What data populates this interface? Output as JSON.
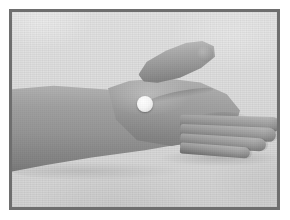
{
  "image": {
    "caption": "Round white tablet resting on the back of an outstretched hand",
    "subject": "forearm and hand, palm down, extended horizontally to the right",
    "orientation": "landscape",
    "color_mode": "grayscale",
    "frame": {
      "border_color": "#6e6e6e",
      "border_width_px": 3,
      "page_background": "#ffffff"
    },
    "palette": {
      "backdrop": "#d9d9d9",
      "skin_light": "#acacac",
      "skin_mid": "#9a9a9a",
      "skin_dark": "#848484",
      "tablet_white": "#ffffff",
      "shadow": "#000000"
    },
    "objects": {
      "arm_label": "forearm",
      "hand_label": "back of hand",
      "thumb_label": "thumb",
      "fingers_label": "fingers",
      "tablet_label": "white round tablet",
      "tablet_position": "back of hand, below the thumb",
      "tablet_diameter_px": 16,
      "finger_count": 4
    }
  }
}
